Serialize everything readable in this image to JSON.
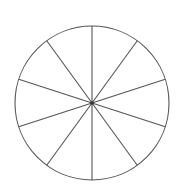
{
  "diagram": {
    "type": "divided-circle",
    "segments": 10,
    "center": [
      92,
      103
    ],
    "radius": 77,
    "start_angle_deg_from_vertical": 0,
    "stroke_color": "#555555",
    "stroke_width": 1.1,
    "background_color": "#ffffff",
    "center_dot_color": "#333333"
  }
}
